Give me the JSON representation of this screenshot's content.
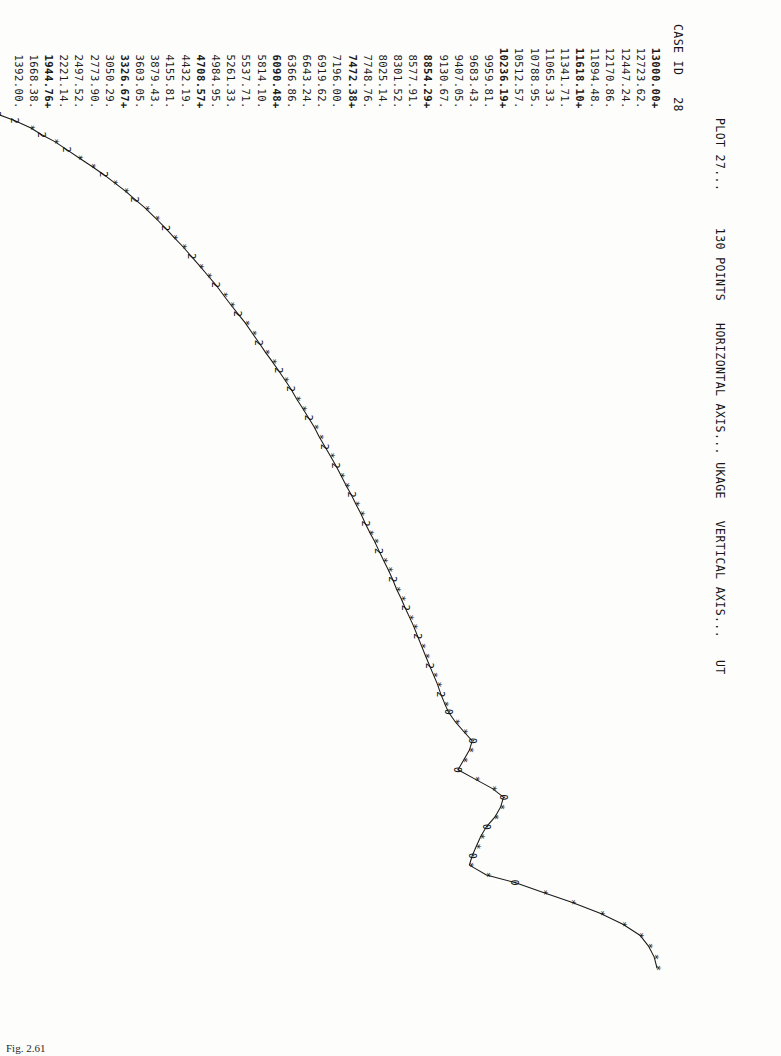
{
  "page": {
    "caption": "Fig. 2.61"
  },
  "header": {
    "plot_label": "PLOT 27...",
    "points_label": "130 POINTS",
    "horizontal_axis_label": "HORIZONTAL AXIS...",
    "horizontal_axis_var": "UKAGE",
    "vertical_axis_label": "VERTICAL AXIS...",
    "vertical_axis_var": "UT",
    "case_id_label": "CASE ID",
    "case_id_value": "28",
    "full_line": "PLOT 27...     130 POINTS   HORIZONTAL AXIS... UKAGE   VERTICAL AXIS...   UT"
  },
  "equation": {
    "prefix": "Y=",
    "intercept": "1123.6685",
    "op1": "+",
    "slope_x": "6.6115",
    "x_term": "X",
    "op2": "+",
    "slope_log": "1577.2427",
    "log_term": "LOG(X)",
    "full": "Y=  1123.6685 +,   6.6115 X + 1577.2427 LOG(X)"
  },
  "chart_data": {
    "type": "scatter",
    "title": "PLOT 27...     130 POINTS   HORIZONTAL AXIS... UKAGE   VERTICAL AXIS...   UT",
    "xlabel": "UKAGE",
    "ylabel": "UT",
    "n_points": 130,
    "grid": false,
    "legend": "none",
    "xlim": [
      1.0,
      157.0
    ],
    "ylim": [
      1392.0,
      13000.0
    ],
    "xticks": [
      1.0,
      16.6,
      32.2,
      47.8,
      63.4,
      79.0,
      94.6,
      110.2,
      125.8,
      141.4,
      157.0
    ],
    "xtick_labels": [
      "1.00",
      "16.60",
      "32.20",
      "47.80",
      "63.40",
      "79.00",
      "94.60",
      "110.20",
      "125.80",
      "141.40",
      "157.00"
    ],
    "ytick_labels": [
      "13000.00",
      "12723.62",
      "12447.24",
      "12170.86",
      "11894.48",
      "11618.10",
      "11341.71",
      "11065.33",
      "10788.95",
      "10512.57",
      "10236.19",
      "9959.81",
      "9683.43",
      "9407.05",
      "9130.67",
      "8854.29",
      "8577.91",
      "8301.52",
      "8025.14",
      "7748.76",
      "7472.38",
      "7196.00",
      "6919.62",
      "6643.24",
      "6366.86",
      "6090.48",
      "5814.10",
      "5537.71",
      "5261.33",
      "4984.95",
      "4708.57",
      "4432.19",
      "4155.81",
      "3879.43",
      "3603.05",
      "3326.67",
      "3050.29",
      "2773.90",
      "2497.52",
      "2221.14",
      "1944.76",
      "1668.38",
      "1392.00"
    ],
    "ytick_markers": [
      "+",
      ".",
      ".",
      ".",
      ".",
      "+",
      ".",
      ".",
      ".",
      ".",
      "+",
      ".",
      ".",
      ".",
      ".",
      "+",
      ".",
      ".",
      ".",
      ".",
      "+",
      ".",
      ".",
      ".",
      ".",
      "+",
      ".",
      ".",
      ".",
      ".",
      "+",
      ".",
      ".",
      ".",
      ".",
      "+",
      ".",
      ".",
      ".",
      ".",
      "+",
      ".",
      "."
    ],
    "curve_note": "fitted logarithmic growth curve with overplotted point symbols (* = 1 point, 2 = 2 coincident points, 0/other digits = higher multiplicity)",
    "points": [
      {
        "x": 1.0,
        "y": 1392.0,
        "sym": "2"
      },
      {
        "x": 2.2,
        "y": 1700.0,
        "sym": "2"
      },
      {
        "x": 3.5,
        "y": 1980.0,
        "sym": "*"
      },
      {
        "x": 4.8,
        "y": 2180.0,
        "sym": "2"
      },
      {
        "x": 6.0,
        "y": 2400.0,
        "sym": "*"
      },
      {
        "x": 7.5,
        "y": 2620.0,
        "sym": "2"
      },
      {
        "x": 9.0,
        "y": 2830.0,
        "sym": "*"
      },
      {
        "x": 10.5,
        "y": 3050.0,
        "sym": "*"
      },
      {
        "x": 12.0,
        "y": 3260.0,
        "sym": "2"
      },
      {
        "x": 13.5,
        "y": 3450.0,
        "sym": "*"
      },
      {
        "x": 15.0,
        "y": 3640.0,
        "sym": "*"
      },
      {
        "x": 16.6,
        "y": 3820.0,
        "sym": "2"
      },
      {
        "x": 18.2,
        "y": 4000.0,
        "sym": "*"
      },
      {
        "x": 20.0,
        "y": 4180.0,
        "sym": "*"
      },
      {
        "x": 21.8,
        "y": 4350.0,
        "sym": "2"
      },
      {
        "x": 23.5,
        "y": 4500.0,
        "sym": "*"
      },
      {
        "x": 25.2,
        "y": 4660.0,
        "sym": "*"
      },
      {
        "x": 27.0,
        "y": 4810.0,
        "sym": "2"
      },
      {
        "x": 28.8,
        "y": 4960.0,
        "sym": "*"
      },
      {
        "x": 30.5,
        "y": 5100.0,
        "sym": "*"
      },
      {
        "x": 32.2,
        "y": 5240.0,
        "sym": "2"
      },
      {
        "x": 34.0,
        "y": 5370.0,
        "sym": "*"
      },
      {
        "x": 35.8,
        "y": 5500.0,
        "sym": "*"
      },
      {
        "x": 37.5,
        "y": 5630.0,
        "sym": "2"
      },
      {
        "x": 39.2,
        "y": 5760.0,
        "sym": "*"
      },
      {
        "x": 41.0,
        "y": 5880.0,
        "sym": "*"
      },
      {
        "x": 42.8,
        "y": 6000.0,
        "sym": "2"
      },
      {
        "x": 44.5,
        "y": 6110.0,
        "sym": "*"
      },
      {
        "x": 46.2,
        "y": 6230.0,
        "sym": "*"
      },
      {
        "x": 47.8,
        "y": 6340.0,
        "sym": "2"
      },
      {
        "x": 49.5,
        "y": 6450.0,
        "sym": "*"
      },
      {
        "x": 51.2,
        "y": 6560.0,
        "sym": "2"
      },
      {
        "x": 53.0,
        "y": 6660.0,
        "sym": "*"
      },
      {
        "x": 54.8,
        "y": 6770.0,
        "sym": "*"
      },
      {
        "x": 56.5,
        "y": 6870.0,
        "sym": "2"
      },
      {
        "x": 58.2,
        "y": 6970.0,
        "sym": "*"
      },
      {
        "x": 60.0,
        "y": 7060.0,
        "sym": "*"
      },
      {
        "x": 61.8,
        "y": 7160.0,
        "sym": "2"
      },
      {
        "x": 63.4,
        "y": 7250.0,
        "sym": "*"
      },
      {
        "x": 65.2,
        "y": 7350.0,
        "sym": "2"
      },
      {
        "x": 67.0,
        "y": 7440.0,
        "sym": "*"
      },
      {
        "x": 68.8,
        "y": 7530.0,
        "sym": "*"
      },
      {
        "x": 70.5,
        "y": 7620.0,
        "sym": "2"
      },
      {
        "x": 72.2,
        "y": 7700.0,
        "sym": "*"
      },
      {
        "x": 74.0,
        "y": 7790.0,
        "sym": "*"
      },
      {
        "x": 75.8,
        "y": 7870.0,
        "sym": "2"
      },
      {
        "x": 77.5,
        "y": 7950.0,
        "sym": "*"
      },
      {
        "x": 79.0,
        "y": 8030.0,
        "sym": "*"
      },
      {
        "x": 80.8,
        "y": 8110.0,
        "sym": "2"
      },
      {
        "x": 82.5,
        "y": 8190.0,
        "sym": "*"
      },
      {
        "x": 84.2,
        "y": 8270.0,
        "sym": "*"
      },
      {
        "x": 86.0,
        "y": 8350.0,
        "sym": "2"
      },
      {
        "x": 87.8,
        "y": 8420.0,
        "sym": "*"
      },
      {
        "x": 89.5,
        "y": 8500.0,
        "sym": "*"
      },
      {
        "x": 91.2,
        "y": 8570.0,
        "sym": "2"
      },
      {
        "x": 93.0,
        "y": 8650.0,
        "sym": "*"
      },
      {
        "x": 94.6,
        "y": 8720.0,
        "sym": "*"
      },
      {
        "x": 96.4,
        "y": 8790.0,
        "sym": "2"
      },
      {
        "x": 98.2,
        "y": 8860.0,
        "sym": "*"
      },
      {
        "x": 100.0,
        "y": 8930.0,
        "sym": "*"
      },
      {
        "x": 101.8,
        "y": 9000.0,
        "sym": "2"
      },
      {
        "x": 103.5,
        "y": 9070.0,
        "sym": "*"
      },
      {
        "x": 105.2,
        "y": 9140.0,
        "sym": "*"
      },
      {
        "x": 107.0,
        "y": 9200.0,
        "sym": "2"
      },
      {
        "x": 108.8,
        "y": 9270.0,
        "sym": "*"
      },
      {
        "x": 110.2,
        "y": 9330.0,
        "sym": "0"
      },
      {
        "x": 112.0,
        "y": 9450.0,
        "sym": "*"
      },
      {
        "x": 113.8,
        "y": 9600.0,
        "sym": "*"
      },
      {
        "x": 115.5,
        "y": 9750.0,
        "sym": "0"
      },
      {
        "x": 117.2,
        "y": 9700.0,
        "sym": "*"
      },
      {
        "x": 119.0,
        "y": 9600.0,
        "sym": "*"
      },
      {
        "x": 120.8,
        "y": 9500.0,
        "sym": "0"
      },
      {
        "x": 122.5,
        "y": 9800.0,
        "sym": "*"
      },
      {
        "x": 124.2,
        "y": 10100.0,
        "sym": "*"
      },
      {
        "x": 125.8,
        "y": 10300.0,
        "sym": "0"
      },
      {
        "x": 127.6,
        "y": 10250.0,
        "sym": "*"
      },
      {
        "x": 129.4,
        "y": 10150.0,
        "sym": "*"
      },
      {
        "x": 131.2,
        "y": 10000.0,
        "sym": "0"
      },
      {
        "x": 133.0,
        "y": 9900.0,
        "sym": "*"
      },
      {
        "x": 134.8,
        "y": 9820.0,
        "sym": "*"
      },
      {
        "x": 136.5,
        "y": 9750.0,
        "sym": "0"
      },
      {
        "x": 138.2,
        "y": 9700.0,
        "sym": "*"
      },
      {
        "x": 140.0,
        "y": 10000.0,
        "sym": "*"
      },
      {
        "x": 141.4,
        "y": 10500.0,
        "sym": "0"
      },
      {
        "x": 143.2,
        "y": 11000.0,
        "sym": "*"
      },
      {
        "x": 145.0,
        "y": 11500.0,
        "sym": "*"
      },
      {
        "x": 147.0,
        "y": 12000.0,
        "sym": "*"
      },
      {
        "x": 149.0,
        "y": 12400.0,
        "sym": "*"
      },
      {
        "x": 151.0,
        "y": 12700.0,
        "sym": "*"
      },
      {
        "x": 153.0,
        "y": 12850.0,
        "sym": "*"
      },
      {
        "x": 155.0,
        "y": 12950.0,
        "sym": "*"
      },
      {
        "x": 157.0,
        "y": 13000.0,
        "sym": "*"
      }
    ]
  }
}
